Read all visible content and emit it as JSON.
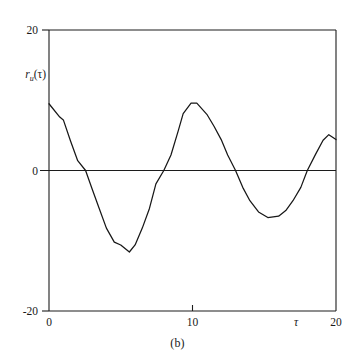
{
  "figure": {
    "caption": "(b)",
    "y_axis_label_variable": "r",
    "y_axis_label_subscript": "u",
    "y_axis_label_arg": "(τ)",
    "x_axis_label": "τ"
  },
  "chart_data": {
    "type": "line",
    "title": "",
    "subtitle": "",
    "caption": "(b)",
    "xlabel": "τ",
    "ylabel": "rᵤ(τ)",
    "xlim": [
      0,
      20
    ],
    "ylim": [
      -20,
      20
    ],
    "xticks": [
      0,
      10,
      20
    ],
    "xtick_labels": [
      "0",
      "10",
      "20"
    ],
    "yticks": [
      -20,
      0,
      20
    ],
    "ytick_labels": [
      "-20",
      "0",
      "20"
    ],
    "grid": false,
    "legend": null,
    "zero_line": true,
    "series": [
      {
        "name": "autocorrelation",
        "color": "#171717",
        "x": [
          0.0,
          0.75,
          1.0,
          1.5,
          2.0,
          2.55,
          3.0,
          3.5,
          4.0,
          4.55,
          5.0,
          5.6,
          6.0,
          6.5,
          7.0,
          7.45,
          8.0,
          8.5,
          9.0,
          9.35,
          9.9,
          10.3,
          11.0,
          11.5,
          12.0,
          12.45,
          13.0,
          13.5,
          14.0,
          14.6,
          15.25,
          16.0,
          16.5,
          17.0,
          17.55,
          18.0,
          18.6,
          19.1,
          19.5,
          20.0
        ],
        "y": [
          9.5,
          7.6,
          7.2,
          4.2,
          1.4,
          0.0,
          -2.6,
          -5.4,
          -8.2,
          -10.2,
          -10.6,
          -11.6,
          -10.6,
          -8.2,
          -5.4,
          -1.9,
          0.0,
          2.2,
          5.6,
          8.1,
          9.6,
          9.6,
          8.0,
          6.3,
          4.4,
          2.2,
          0.0,
          -2.4,
          -4.3,
          -5.9,
          -6.7,
          -6.5,
          -5.7,
          -4.3,
          -2.4,
          0.0,
          2.4,
          4.3,
          5.1,
          4.4
        ]
      }
    ]
  }
}
